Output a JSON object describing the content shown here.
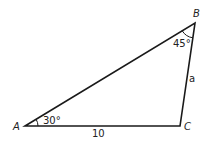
{
  "diagram": {
    "type": "triangle",
    "vertices": {
      "A": {
        "label": "A",
        "x": 25,
        "y": 126
      },
      "B": {
        "label": "B",
        "x": 195,
        "y": 23
      },
      "C": {
        "label": "C",
        "x": 180,
        "y": 126
      }
    },
    "angles": {
      "A": "30°",
      "B": "45°"
    },
    "sides": {
      "AC": "10",
      "BC": "a"
    },
    "line_color": "#1a1a1a"
  }
}
